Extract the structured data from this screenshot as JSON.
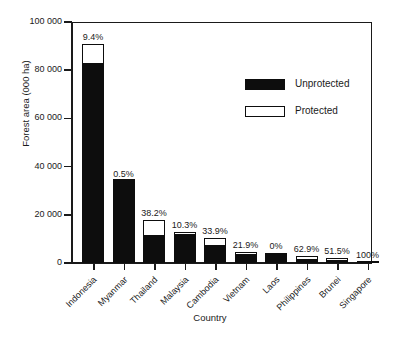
{
  "chart_data": {
    "type": "bar",
    "title": "",
    "subtitle": "",
    "xlabel": "Country",
    "ylabel": "Forest area (000 ha)",
    "ylim": [
      0,
      100000
    ],
    "yticks": [
      0,
      20000,
      40000,
      60000,
      80000,
      100000
    ],
    "ytick_labels": [
      "0",
      "20 000",
      "40 000",
      "60 000",
      "80 000",
      "100 000"
    ],
    "grid": false,
    "stacked": true,
    "legend_position": "inside-top-right",
    "categories": [
      "Indonesia",
      "Myanmar",
      "Thailand",
      "Malaysia",
      "Cambodia",
      "Vietnam",
      "Laos",
      "Philippines",
      "Brunei",
      "Singapore"
    ],
    "series": [
      {
        "name": "Unprotected",
        "color": "#0d0d0d",
        "values": [
          82400,
          33830,
          11100,
          11700,
          6900,
          3500,
          4000,
          1110,
          970,
          0
        ]
      },
      {
        "name": "Protected",
        "color": "#ffffff",
        "values": [
          8600,
          170,
          6900,
          1300,
          3600,
          1000,
          0,
          1890,
          1030,
          100
        ]
      }
    ],
    "totals": [
      91000,
      34000,
      18000,
      13000,
      10500,
      4500,
      4000,
      3000,
      2000,
      100
    ],
    "annotations": [
      "9.4%",
      "0.5%",
      "38.2%",
      "10.3%",
      "33.9%",
      "21.9%",
      "0%",
      "62.9%",
      "51.5%",
      "100%"
    ],
    "annotation_meaning": "Percentage protected"
  },
  "legend": {
    "items": [
      {
        "label": "Unprotected",
        "swatch": "filled"
      },
      {
        "label": "Protected",
        "swatch": "hollow"
      }
    ]
  }
}
